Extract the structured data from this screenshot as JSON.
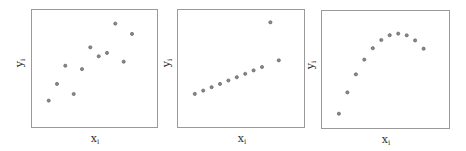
{
  "chart_data": [
    {
      "type": "scatter",
      "title": "",
      "xlabel": "x_i",
      "ylabel": "y_i",
      "xlim": [
        2,
        17
      ],
      "ylim": [
        2,
        12
      ],
      "grid": false,
      "ticks": false,
      "x": [
        4,
        5,
        6,
        7,
        8,
        9,
        10,
        11,
        12,
        13,
        14
      ],
      "y": [
        4.26,
        5.68,
        7.24,
        4.82,
        6.95,
        8.81,
        8.04,
        8.33,
        10.84,
        7.58,
        9.96
      ]
    },
    {
      "type": "scatter",
      "title": "",
      "xlabel": "x_i",
      "ylabel": "y_i",
      "xlim": [
        2,
        17
      ],
      "ylim": [
        2,
        14
      ],
      "grid": false,
      "ticks": false,
      "x": [
        4,
        5,
        6,
        7,
        8,
        9,
        10,
        11,
        12,
        13,
        14
      ],
      "y": [
        5.39,
        5.73,
        6.08,
        6.42,
        6.77,
        7.11,
        7.46,
        7.81,
        8.15,
        12.74,
        8.84
      ]
    },
    {
      "type": "scatter",
      "title": "",
      "xlabel": "x_i",
      "ylabel": "y_i",
      "xlim": [
        2,
        17
      ],
      "ylim": [
        2,
        11
      ],
      "grid": false,
      "ticks": false,
      "x": [
        4,
        5,
        6,
        7,
        8,
        9,
        10,
        11,
        12,
        13,
        14
      ],
      "y": [
        3.1,
        4.74,
        6.13,
        7.26,
        8.14,
        8.77,
        9.14,
        9.26,
        9.13,
        8.74,
        8.1
      ]
    }
  ],
  "labels": {
    "x_main": "x",
    "y_main": "y",
    "subscript": "i"
  },
  "style": {
    "frame_color": "#9a9a9a",
    "marker_fill": "#8a8a8a",
    "marker_stroke": "#555555"
  }
}
